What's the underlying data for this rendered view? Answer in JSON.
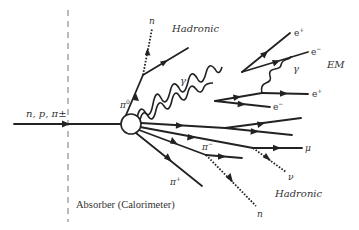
{
  "diagram": {
    "boundary_label": "Absorber (Calorimeter)",
    "incident_particle_label": "n, p, π±",
    "interaction_vertex": "nuclear interaction",
    "regions": {
      "hadronic_top": "Hadronic",
      "em": "EM",
      "hadronic_bottom": "Hadronic"
    },
    "particles": {
      "pi0": "π0",
      "pi0_sup": "0",
      "neutron_top": "n",
      "gamma_main": "γ",
      "gamma_secondary": "γ",
      "e_plus_1": "e+",
      "e_minus_1": "e−",
      "e_plus_2": "e+",
      "e_minus_2": "e−",
      "pi_minus": "π−",
      "pi_plus": "π+",
      "mu": "μ",
      "nu": "ν",
      "neutron_bottom": "n"
    },
    "labels_display": {
      "pi_base": "π",
      "e_base": "e",
      "plus": "+",
      "minus": "−",
      "zero": "0",
      "pm": "±"
    }
  }
}
